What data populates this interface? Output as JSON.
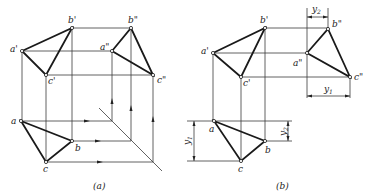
{
  "figure_a": {
    "caption": "(a)",
    "labels": {
      "a_front": "a'",
      "b_front": "b'",
      "c_front": "c'",
      "a_side": "a\"",
      "b_side": "b\"",
      "c_side": "c\"",
      "a_top": "a",
      "b_top": "b",
      "c_top": "c"
    }
  },
  "figure_b": {
    "caption": "(b)",
    "labels": {
      "a_front": "a'",
      "b_front": "b'",
      "c_front": "c'",
      "a_side": "a\"",
      "b_side": "b\"",
      "c_side": "c\"",
      "a_top": "a",
      "b_top": "b",
      "c_top": "c"
    },
    "dimensions": {
      "y1_base": "y",
      "y1_sub": "1",
      "y2_base": "y",
      "y2_sub": "2"
    }
  }
}
